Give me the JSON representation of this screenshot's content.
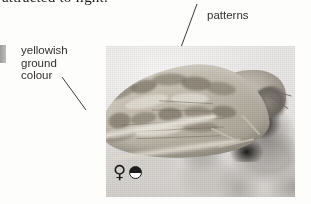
{
  "page": {
    "background_color": "#fdfdfc",
    "running_text_cut_off": "attracted to light."
  },
  "margin_tab": {
    "color": "#9c9c9c"
  },
  "callouts": {
    "left": {
      "text": "yellowish\nground\ncolour",
      "color": "#33302e"
    },
    "top": {
      "cut_off_line": "........",
      "text": "patterns",
      "color": "#33302e"
    }
  },
  "leader_lines": [
    {
      "name": "ground-colour-leader",
      "x1": 62,
      "y1": 77,
      "x2": 86,
      "y2": 110,
      "color": "#3a3a3a"
    },
    {
      "name": "patterns-leader",
      "x1": 197,
      "y1": 4,
      "x2": 160,
      "y2": 104,
      "color": "#3a3a3a"
    }
  ],
  "photo": {
    "subject": "moth-specimen-photograph",
    "alt": "Greyscale photograph of a moth at rest showing yellowish ground colour forewings with darker patterns",
    "frame": {
      "left": 106,
      "top": 46,
      "width": 189,
      "height": 151
    },
    "background_color": "#f2f0ee"
  },
  "symbols": {
    "sex": {
      "name": "female-symbol",
      "glyph": "♀",
      "meaning": "female"
    },
    "status": {
      "name": "half-filled-circle-symbol",
      "glyph": "◓",
      "meaning": "half-filled circle indicator"
    }
  }
}
